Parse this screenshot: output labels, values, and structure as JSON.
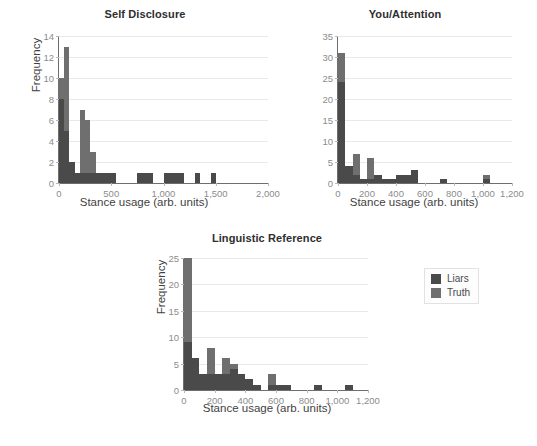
{
  "figure": {
    "background": "#ffffff",
    "axis_color": "#6e6e6e",
    "grid_color": "#e9e9e9",
    "tick_text_color": "#8c8c8c"
  },
  "legend": {
    "position": "right-middle",
    "entries": [
      {
        "label": "Liars",
        "color": "#4a4a4a"
      },
      {
        "label": "Truth",
        "color": "#6f6f6f"
      }
    ]
  },
  "chart_data": [
    {
      "id": "self-disclosure",
      "type": "bar",
      "subtype": "stacked-histogram",
      "title": "Self Disclosure",
      "xlabel": "Stance usage (arb. units)",
      "ylabel": "Frequency",
      "xlim": [
        0,
        2000
      ],
      "ylim": [
        0,
        14
      ],
      "xticks": [
        0,
        500,
        1000,
        1500,
        2000
      ],
      "xticklabels": [
        "0",
        "500",
        "1,000",
        "1,500",
        "2,000"
      ],
      "yticks": [
        0,
        2,
        4,
        6,
        8,
        10,
        12,
        14
      ],
      "yticklabels": [
        "0",
        "2",
        "4",
        "6",
        "8",
        "10",
        "12",
        "14"
      ],
      "grid": "y",
      "legend": "external",
      "bin_width": 50,
      "bin_starts": [
        0,
        50,
        100,
        150,
        200,
        250,
        300,
        350,
        400,
        450,
        500,
        550,
        600,
        650,
        700,
        750,
        800,
        850,
        900,
        950,
        1000,
        1050,
        1100,
        1150,
        1200,
        1250,
        1300,
        1350,
        1400,
        1450,
        1500,
        1550,
        1600
      ],
      "series": [
        {
          "name": "Liars",
          "color": "#4a4a4a",
          "values": [
            8,
            5,
            2,
            1,
            1,
            1,
            1,
            1,
            1,
            1,
            1,
            0,
            0,
            0,
            0,
            1,
            1,
            1,
            0,
            0,
            1,
            1,
            1,
            1,
            0,
            0,
            1,
            0,
            0,
            1,
            0,
            0,
            0
          ]
        },
        {
          "name": "Truth",
          "color": "#6f6f6f",
          "values": [
            2,
            8,
            0,
            0,
            6,
            5,
            2,
            0,
            0,
            0,
            0,
            0,
            0,
            0,
            0,
            0,
            0,
            0,
            0,
            0,
            0,
            0,
            0,
            0,
            0,
            0,
            0,
            0,
            0,
            0,
            0,
            0,
            0
          ]
        }
      ],
      "totals": [
        10,
        13,
        2,
        1,
        7,
        6,
        3,
        1,
        1,
        1,
        1,
        0,
        0,
        0,
        0,
        1,
        1,
        1,
        0,
        0,
        1,
        1,
        1,
        1,
        0,
        0,
        1,
        0,
        0,
        1,
        0,
        0,
        0
      ]
    },
    {
      "id": "you-attention",
      "type": "bar",
      "subtype": "stacked-histogram",
      "title": "You/Attention",
      "xlabel": "Stance usage (arb. units)",
      "ylabel": "",
      "xlim": [
        0,
        1200
      ],
      "ylim": [
        0,
        35
      ],
      "xticks": [
        0,
        200,
        400,
        600,
        800,
        1000,
        1200
      ],
      "xticklabels": [
        "0",
        "200",
        "400",
        "600",
        "800",
        "1,000",
        "1,200"
      ],
      "yticks": [
        0,
        5,
        10,
        15,
        20,
        25,
        30,
        35
      ],
      "yticklabels": [
        "0",
        "5",
        "10",
        "15",
        "20",
        "25",
        "30",
        "35"
      ],
      "grid": "y",
      "legend": "external",
      "bin_width": 50,
      "bin_starts": [
        0,
        50,
        100,
        150,
        200,
        250,
        300,
        350,
        400,
        450,
        500,
        550,
        600,
        650,
        700,
        750,
        800,
        850,
        900,
        950,
        1000,
        1050,
        1100,
        1150
      ],
      "series": [
        {
          "name": "Liars",
          "color": "#4a4a4a",
          "values": [
            24,
            4,
            2,
            1,
            1,
            2,
            1,
            1,
            2,
            2,
            3,
            0,
            0,
            0,
            1,
            0,
            0,
            0,
            0,
            0,
            1,
            0,
            0,
            0
          ]
        },
        {
          "name": "Truth",
          "color": "#6f6f6f",
          "values": [
            7,
            0,
            5,
            0,
            5,
            0,
            0,
            0,
            0,
            0,
            0,
            0,
            0,
            0,
            0,
            0,
            0,
            0,
            0,
            0,
            1,
            0,
            0,
            0
          ]
        }
      ],
      "totals": [
        31,
        4,
        7,
        1,
        6,
        2,
        1,
        1,
        2,
        2,
        3,
        0,
        0,
        0,
        1,
        0,
        0,
        0,
        0,
        0,
        2,
        0,
        0,
        0
      ]
    },
    {
      "id": "linguistic-reference",
      "type": "bar",
      "subtype": "stacked-histogram",
      "title": "Linguistic Reference",
      "xlabel": "Stance usage (arb. units)",
      "ylabel": "Frequency",
      "xlim": [
        0,
        1200
      ],
      "ylim": [
        0,
        25
      ],
      "xticks": [
        0,
        200,
        400,
        600,
        800,
        1000,
        1200
      ],
      "xticklabels": [
        "0",
        "200",
        "400",
        "600",
        "800",
        "1,000",
        "1,200"
      ],
      "yticks": [
        0,
        5,
        10,
        15,
        20,
        25
      ],
      "yticklabels": [
        "0",
        "5",
        "10",
        "15",
        "20",
        "25"
      ],
      "grid": "y",
      "legend": "external",
      "bin_width": 50,
      "bin_starts": [
        0,
        50,
        100,
        150,
        200,
        250,
        300,
        350,
        400,
        450,
        500,
        550,
        600,
        650,
        700,
        750,
        800,
        850,
        900,
        950,
        1000,
        1050,
        1100,
        1150
      ],
      "series": [
        {
          "name": "Liars",
          "color": "#4a4a4a",
          "values": [
            9,
            6,
            3,
            3,
            3,
            3,
            4,
            3,
            2,
            1,
            0,
            1,
            1,
            1,
            0,
            0,
            0,
            1,
            0,
            0,
            0,
            1,
            0,
            0
          ]
        },
        {
          "name": "Truth",
          "color": "#6f6f6f",
          "values": [
            16,
            0,
            0,
            5,
            0,
            3,
            1,
            0,
            0,
            0,
            0,
            2,
            0,
            0,
            0,
            0,
            0,
            0,
            0,
            0,
            0,
            0,
            0,
            0
          ]
        }
      ],
      "totals": [
        25,
        6,
        3,
        8,
        3,
        6,
        5,
        3,
        2,
        1,
        0,
        3,
        1,
        1,
        0,
        0,
        0,
        1,
        0,
        0,
        0,
        1,
        0,
        0
      ]
    }
  ]
}
